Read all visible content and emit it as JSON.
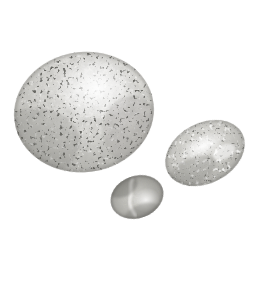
{
  "image": {
    "subject": "three speckled bird eggs",
    "medium": "photograph",
    "background_color": "#ffffff",
    "width": 260,
    "height": 290,
    "description": "Three gray speckled eggs of decreasing size arranged on a plain white background"
  },
  "palette": {
    "background": "#ffffff",
    "shell_light": "#efefee",
    "shell_base": "#d3d2cf",
    "shell_mid": "#b3b2ae",
    "shell_dark": "#8c8b87",
    "speckle_dark": "#3a3a38",
    "speckle_black": "#222221",
    "speckle_mid": "#75746f",
    "highlight": "#fbfbfa",
    "rim_shadow": "#6e6d69"
  },
  "eggs": [
    {
      "name": "large-egg",
      "label": "Large speckled egg",
      "cx": 84,
      "cy": 112,
      "rx": 70,
      "ry": 60,
      "rotation": -8,
      "speckle_density": "heavy",
      "highlight_x": 96,
      "highlight_y": 88
    },
    {
      "name": "medium-egg",
      "label": "Medium speckled egg",
      "cx": 205,
      "cy": 153,
      "rx": 42,
      "ry": 30,
      "rotation": -28,
      "speckle_density": "medium",
      "highlight_x": 205,
      "highlight_y": 146
    },
    {
      "name": "small-egg",
      "label": "Small dark egg",
      "cx": 137,
      "cy": 197,
      "rx": 27,
      "ry": 21,
      "rotation": -20,
      "speckle_density": "light",
      "highlight_x": 134,
      "highlight_y": 196
    }
  ]
}
